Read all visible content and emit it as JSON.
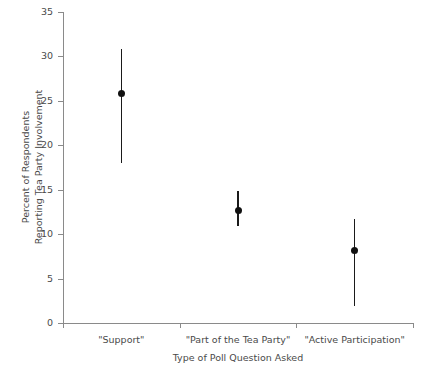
{
  "chart_data": {
    "type": "scatter",
    "title": "",
    "subtitle": "",
    "xlabel": "Type of Poll Question Asked",
    "ylabel_line1": "Percent of Respondents",
    "ylabel_line2": "Reporting Tea Party Involvement",
    "categories": [
      "\"Support\"",
      "\"Part of the Tea Party\"",
      "\"Active Participation\""
    ],
    "values": [
      25.8,
      12.7,
      8.2
    ],
    "error_low": [
      18.0,
      10.9,
      1.9
    ],
    "error_high": [
      30.8,
      14.8,
      11.7
    ],
    "ylim": [
      0,
      35
    ],
    "yticks": [
      0,
      5,
      10,
      15,
      20,
      25,
      30,
      35
    ],
    "ytick_labels": [
      "0",
      "5",
      "10",
      "15",
      "20",
      "25",
      "30",
      "35"
    ],
    "grid": false,
    "legend": "none",
    "marker": "filled-circle",
    "marker_color": "#111111",
    "error_bar_color": "#1a1a1a",
    "axis_color": "#8a8a8a",
    "background_color": "#ffffff",
    "points": [
      {
        "category": "\"Support\"",
        "value": 25.8,
        "low": 18.0,
        "high": 30.8
      },
      {
        "category": "\"Part of the Tea Party\"",
        "value": 12.7,
        "low": 10.9,
        "high": 14.8
      },
      {
        "category": "\"Active Participation\"",
        "value": 8.2,
        "low": 1.9,
        "high": 11.7
      }
    ]
  }
}
